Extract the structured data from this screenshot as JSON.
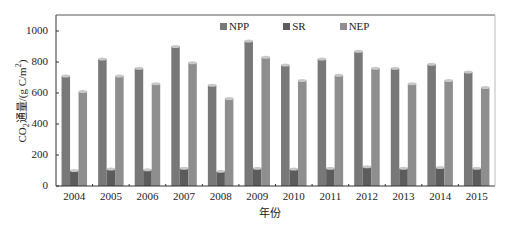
{
  "chart_data": {
    "type": "bar",
    "title": "",
    "xlabel": "年份",
    "ylabel": "CO2通量/(g C/m2)",
    "ylabel_parts": {
      "pre": "CO",
      "sub": "2",
      "mid": "通量/(g C/m",
      "sup": "2",
      "post": ")"
    },
    "ylim": [
      0,
      1100
    ],
    "yticks": [
      0,
      200,
      400,
      600,
      800,
      1000
    ],
    "grid": false,
    "legend_position": "top-center-inside",
    "categories": [
      "2004",
      "2005",
      "2006",
      "2007",
      "2008",
      "2009",
      "2010",
      "2011",
      "2012",
      "2013",
      "2014",
      "2015"
    ],
    "series": [
      {
        "name": "NPP",
        "color": "#787878",
        "values": [
          710,
          820,
          760,
          900,
          650,
          935,
          780,
          820,
          870,
          760,
          785,
          735
        ]
      },
      {
        "name": "SR",
        "color": "#5c5c5c",
        "values": [
          100,
          110,
          105,
          115,
          95,
          115,
          110,
          115,
          125,
          115,
          120,
          115
        ]
      },
      {
        "name": "NEP",
        "color": "#8e8e8e",
        "values": [
          610,
          710,
          660,
          795,
          565,
          830,
          680,
          715,
          760,
          660,
          680,
          635
        ]
      }
    ]
  },
  "legend": {
    "items": [
      {
        "label": "NPP",
        "color": "#787878"
      },
      {
        "label": "SR",
        "color": "#5c5c5c"
      },
      {
        "label": "NEP",
        "color": "#8e8e8e"
      }
    ]
  },
  "axes": {
    "xlabel": "年份",
    "ytick_labels": [
      "0",
      "200",
      "400",
      "600",
      "800",
      "1000"
    ]
  }
}
